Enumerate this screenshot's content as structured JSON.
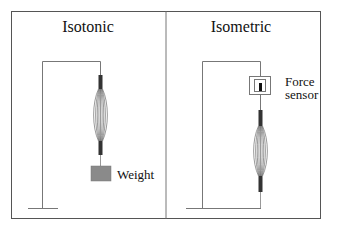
{
  "figure": {
    "panels": [
      {
        "title": "Isotonic",
        "components": [
          "stand",
          "muscle",
          "weight"
        ],
        "weight_label": "Weight"
      },
      {
        "title": "Isometric",
        "components": [
          "stand",
          "force-sensor",
          "muscle"
        ],
        "sensor_label_line1": "Force",
        "sensor_label_line2": "sensor"
      }
    ],
    "colors": {
      "frame": "#555555",
      "line": "#666666",
      "muscle": "#333333",
      "weight": "#8a8a8a",
      "sensor_bar": "#111111"
    }
  }
}
